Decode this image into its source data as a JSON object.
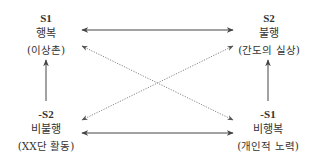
{
  "diagram": {
    "type": "semiotic-square",
    "nodes": {
      "s1": {
        "code": "S1",
        "label": "행복",
        "example": "(이상촌)"
      },
      "s2": {
        "code": "S2",
        "label": "불행",
        "example": "(간도의 실상)"
      },
      "not_s2": {
        "code": "-S2",
        "label": "비불행",
        "example": "(XX단 활동)"
      },
      "not_s1": {
        "code": "-S1",
        "label": "비행복",
        "example": "(개인적 노력)"
      }
    },
    "edges": [
      {
        "from": "s1",
        "to": "s2",
        "style": "solid",
        "direction": "both",
        "relation": "contrariety"
      },
      {
        "from": "not_s2",
        "to": "not_s1",
        "style": "solid",
        "direction": "both",
        "relation": "subcontrariety"
      },
      {
        "from": "not_s2",
        "to": "s1",
        "style": "solid",
        "direction": "forward",
        "relation": "implication"
      },
      {
        "from": "not_s1",
        "to": "s2",
        "style": "solid",
        "direction": "forward",
        "relation": "implication"
      },
      {
        "from": "s1",
        "to": "not_s1",
        "style": "dotted",
        "direction": "both",
        "relation": "contradiction"
      },
      {
        "from": "s2",
        "to": "not_s2",
        "style": "dotted",
        "direction": "both",
        "relation": "contradiction"
      }
    ],
    "colors": {
      "line": "#444444",
      "dotted": "#888888",
      "text": "#333333"
    }
  }
}
